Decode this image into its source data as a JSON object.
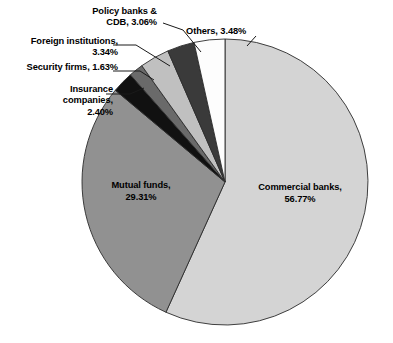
{
  "chart_data": {
    "type": "pie",
    "title": "",
    "subtitle": "",
    "xlabel": "",
    "ylabel": "",
    "legend_position": "none",
    "grid": false,
    "units": "percent",
    "start_angle_deg": 0,
    "direction": "clockwise",
    "categories": [
      "Commercial banks",
      "Mutual funds",
      "Insurance companies",
      "Security firms",
      "Foreign institutions",
      "Policy banks & CDB",
      "Others"
    ],
    "values": [
      56.77,
      29.31,
      2.4,
      1.63,
      3.34,
      3.06,
      3.48
    ],
    "colors": [
      "#d4d4d4",
      "#919191",
      "#111111",
      "#6a6a6a",
      "#c0c0c0",
      "#3a3a3a",
      "#fdfdfd"
    ],
    "slices": [
      {
        "name": "Commercial banks",
        "value": 56.77,
        "color": "#d4d4d4",
        "label_text": "Commercial banks,",
        "label_value": "56.77%",
        "label_placement": "inside"
      },
      {
        "name": "Mutual funds",
        "value": 29.31,
        "color": "#919191",
        "label_text": "Mutual funds,",
        "label_value": "29.31%",
        "label_placement": "inside"
      },
      {
        "name": "Insurance companies",
        "value": 2.4,
        "color": "#111111",
        "label_line1": "Insurance",
        "label_line2": "companies,",
        "label_line3": "2.40%",
        "label_placement": "callout"
      },
      {
        "name": "Security firms",
        "value": 1.63,
        "color": "#6a6a6a",
        "label_line1": "Security firms, 1.63%",
        "label_placement": "callout"
      },
      {
        "name": "Foreign institutions",
        "value": 3.34,
        "color": "#c0c0c0",
        "label_line1": "Foreign institutions,",
        "label_line2": "3.34%",
        "label_placement": "callout"
      },
      {
        "name": "Policy banks & CDB",
        "value": 3.06,
        "color": "#3a3a3a",
        "label_line1": "Policy banks &",
        "label_line2": "CDB, 3.06%",
        "label_placement": "callout"
      },
      {
        "name": "Others",
        "value": 3.48,
        "color": "#fdfdfd",
        "label_line1": "Others, 3.48%",
        "label_placement": "callout"
      }
    ]
  },
  "geometry": {
    "cx": 225,
    "cy": 182,
    "r": 143
  },
  "style": {
    "background": "#ffffff",
    "stroke": "#2b2b2b",
    "text_color": "#000000"
  }
}
